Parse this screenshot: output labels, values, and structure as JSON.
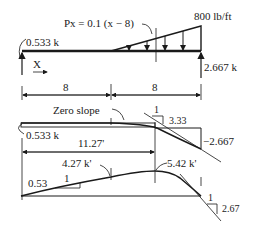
{
  "diagram": {
    "load": {
      "formula": "Px = 0.1 (x − 8)",
      "max_intensity": "800 lb/ft",
      "left_reaction": "0.533 k",
      "right_reaction": "2.667 k",
      "x_axis": "X"
    },
    "dimensions": [
      "8",
      "8"
    ],
    "shear": {
      "zero_slope": "Zero slope",
      "start_value": "0.533 k",
      "end_value": "−2.667",
      "slope_run": "1",
      "slope_rise": "3.33",
      "zero_shear_location": "11.27'"
    },
    "moment": {
      "at_midspan": "4.27 k'",
      "max": "5.42 k'",
      "left_slope_rise": "0.53",
      "left_slope_run": "1",
      "right_slope_run": "1",
      "right_slope_rise": "2.67"
    },
    "colors": {
      "ink": "#1a1a1a",
      "background": "#ffffff"
    }
  }
}
